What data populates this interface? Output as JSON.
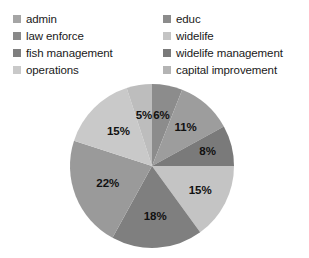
{
  "legend": {
    "left_column": [
      {
        "label": "admin",
        "color": "#a5a5a5"
      },
      {
        "label": "law enforce",
        "color": "#898989"
      },
      {
        "label": "fish management",
        "color": "#7f7f7f"
      },
      {
        "label": "operations",
        "color": "#c9c9c9"
      }
    ],
    "right_column": [
      {
        "label": "educ",
        "color": "#8c8c8c"
      },
      {
        "label": "widelife",
        "color": "#c4c4c4"
      },
      {
        "label": "widelife management",
        "color": "#7a7a7a"
      },
      {
        "label": "capital improvement",
        "color": "#b4b4b4"
      }
    ]
  },
  "chart_data": {
    "type": "pie",
    "title": "",
    "legend_position": "top",
    "labels_format": "percent",
    "categories": [
      "educ",
      "law enforce",
      "widelife management",
      "widelife",
      "fish management",
      "capital improvement",
      "operations",
      "admin"
    ],
    "values": [
      6,
      11,
      8,
      15,
      18,
      22,
      15,
      5
    ],
    "data_labels": [
      "6%",
      "11%",
      "8%",
      "15%",
      "18%",
      "22%",
      "15%",
      "5%"
    ],
    "colors": [
      "#8c8c8c",
      "#9d9d9d",
      "#7a7a7a",
      "#c4c4c4",
      "#7f7f7f",
      "#9a9a9a",
      "#c9c9c9",
      "#bdbdbd"
    ],
    "start_angle_deg": 0,
    "direction": "clockwise"
  },
  "pie_labels": {
    "s0": "6%",
    "s1": "11%",
    "s2": "8%",
    "s3": "15%",
    "s4": "18%",
    "s5": "22%",
    "s6": "15%",
    "s7": "5%"
  }
}
